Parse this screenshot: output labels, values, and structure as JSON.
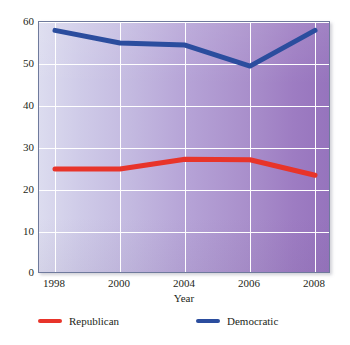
{
  "chart_data": {
    "type": "line",
    "title": "",
    "subtitle": "",
    "xlabel": "Year",
    "ylabel": "",
    "categories": [
      "1998",
      "2000",
      "2004",
      "2006",
      "2008"
    ],
    "x": [
      1998,
      2000,
      2004,
      2006,
      2008
    ],
    "series": [
      {
        "name": "Republican",
        "color": "#e8342a",
        "values": [
          25.0,
          25.0,
          27.3,
          27.2,
          23.5
        ]
      },
      {
        "name": "Democratic",
        "color": "#2b4d9e",
        "values": [
          58.0,
          55.0,
          54.5,
          49.5,
          58.0
        ]
      }
    ],
    "ylim": [
      0,
      60
    ],
    "yticks": [
      0,
      10,
      20,
      30,
      40,
      50,
      60
    ],
    "ytick_labels": [
      "0",
      "10",
      "20",
      "30",
      "40",
      "50",
      "60"
    ],
    "xticks": [
      1998,
      2000,
      2004,
      2006,
      2008
    ],
    "xtick_labels": [
      "1998",
      "2000",
      "2004",
      "2006",
      "2008"
    ],
    "grid": true,
    "grid_color": "#ffffff",
    "legend_position": "bottom",
    "x_spacing": "categorical",
    "plot_background": {
      "type": "horizontal-gradient",
      "from": "#dcdcef",
      "to": "#9674bd"
    },
    "frame_color": "#6f7a9c"
  },
  "axis": {
    "y_ticks": [
      "60",
      "50",
      "40",
      "30",
      "20",
      "10",
      "0"
    ],
    "x_ticks": [
      "1998",
      "2000",
      "2004",
      "2006",
      "2008"
    ],
    "x_title": "Year"
  },
  "legend": {
    "items": [
      {
        "label": "Republican",
        "color": "#e8342a"
      },
      {
        "label": "Democratic",
        "color": "#2b4d9e"
      }
    ]
  }
}
